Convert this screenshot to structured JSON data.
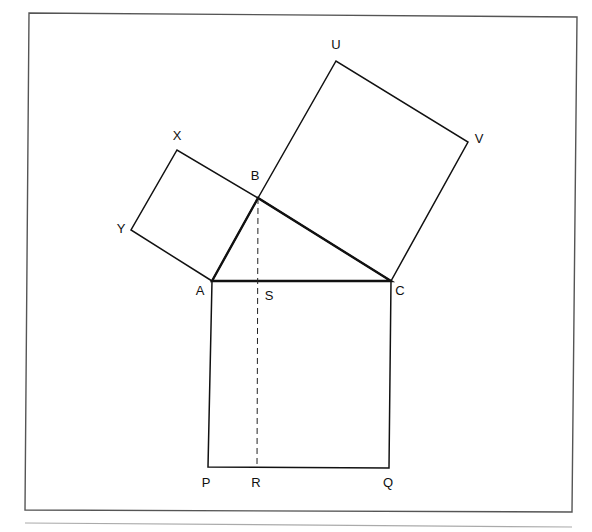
{
  "diagram": {
    "title": "",
    "points": {
      "A": {
        "x": 212,
        "y": 281,
        "label": "A",
        "lx": 200,
        "ly": 292
      },
      "B": {
        "x": 258,
        "y": 198,
        "label": "B",
        "lx": 255,
        "ly": 177
      },
      "C": {
        "x": 391,
        "y": 281,
        "label": "C",
        "lx": 400,
        "ly": 292
      },
      "S": {
        "x": 258,
        "y": 281,
        "label": "S",
        "lx": 269,
        "ly": 297
      },
      "P": {
        "x": 208,
        "y": 467,
        "label": "P",
        "lx": 206,
        "ly": 484
      },
      "Q": {
        "x": 389,
        "y": 468,
        "label": "Q",
        "lx": 388,
        "ly": 484
      },
      "R": {
        "x": 257,
        "y": 467,
        "label": "R",
        "lx": 256,
        "ly": 484
      },
      "X": {
        "x": 177,
        "y": 150,
        "label": "X",
        "lx": 177,
        "ly": 137
      },
      "Y": {
        "x": 131,
        "y": 230,
        "label": "Y",
        "lx": 121,
        "ly": 230
      },
      "U": {
        "x": 336,
        "y": 61,
        "label": "U",
        "lx": 336,
        "ly": 46
      },
      "V": {
        "x": 468,
        "y": 142,
        "label": "V",
        "lx": 479,
        "ly": 140
      }
    },
    "shapes": {
      "triangle_ABC": "212,281 258,198 391,281",
      "square_ABXY": "212,281 131,230 177,150 258,198",
      "square_BCVU": "258,198 336,61 468,142 391,281",
      "square_ACQP": "212,281 208,467 389,468 391,281"
    },
    "altitude": {
      "from": "B",
      "through": "S",
      "to": "R",
      "style": "dashed"
    },
    "frame": {
      "x1": 29,
      "y1": 13,
      "x2": 577,
      "y2": 17,
      "x3": 572,
      "y3": 512,
      "x4": 25,
      "y4": 510
    },
    "rule": {
      "x1": 25,
      "y1": 523,
      "x2": 572,
      "y2": 527
    },
    "colors": {
      "stroke": "#111111",
      "frame": "#555555",
      "rule": "#aaaaaa",
      "background": "#ffffff"
    }
  }
}
